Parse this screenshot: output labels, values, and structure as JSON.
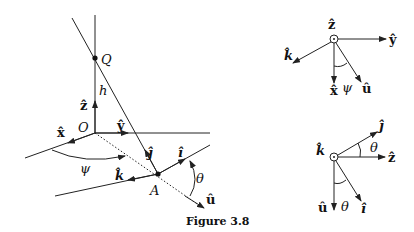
{
  "figure": {
    "caption": "Figure 3.8",
    "main": {
      "labels": {
        "Q": "Q",
        "h": "h",
        "z_hat": "ẑ",
        "O": "O",
        "x_hat": "x̂",
        "y_hat": "ŷ",
        "j_hat": "ĵ",
        "i_hat": "î",
        "k_hat": "k̂",
        "psi": "ψ",
        "A": "A",
        "theta": "θ",
        "u_hat": "û"
      }
    },
    "inset_top": {
      "labels": {
        "z_hat": "ẑ",
        "y_hat": "ŷ",
        "k_hat": "k̂",
        "x_hat": "x̂",
        "psi": "ψ",
        "u_hat": "û"
      }
    },
    "inset_bottom": {
      "labels": {
        "k_hat": "k̂",
        "j_hat": "ĵ",
        "theta1": "θ",
        "z_hat": "ẑ",
        "u_hat": "û",
        "theta2": "θ",
        "i_hat": "î"
      }
    }
  }
}
